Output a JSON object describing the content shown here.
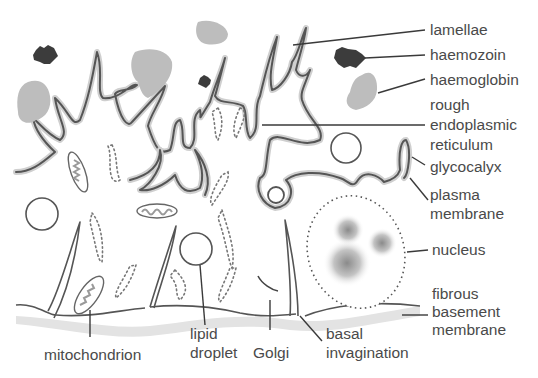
{
  "colors": {
    "membrane": "#555555",
    "membrane_halo": "#cfcfcf",
    "haemoglobin": "#bdbdbd",
    "haemozoin": "#3c3c3c",
    "label_text": "#4a4a4a",
    "basement": "#e3e3e3"
  },
  "labels": {
    "lamellae": "lamellae",
    "haemozoin": "haemozoin",
    "haemoglobin": "haemoglobin",
    "rer": [
      "rough",
      "endoplasmic",
      "reticulum"
    ],
    "glycocalyx": "glycocalyx",
    "plasma_membrane": [
      "plasma",
      "membrane"
    ],
    "nucleus": "nucleus",
    "fibrous_basement_membrane": [
      "fibrous",
      "basement",
      "membrane"
    ],
    "mitochondrion": "mitochondrion",
    "lipid_droplet": [
      "lipid",
      "droplet"
    ],
    "golgi": "Golgi",
    "basal_invagination": [
      "basal",
      "invagination"
    ]
  }
}
